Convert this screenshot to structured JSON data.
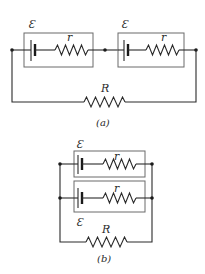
{
  "figure": {
    "panel_a": {
      "caption": "(a)",
      "description": "Two cells in series connected to external resistor",
      "cells": [
        {
          "emf_label": "Ɛ",
          "internal_resistance_label": "r"
        },
        {
          "emf_label": "Ɛ",
          "internal_resistance_label": "r"
        }
      ],
      "external_resistor_label": "R"
    },
    "panel_b": {
      "caption": "(b)",
      "description": "Two cells in parallel connected to external resistor",
      "cells": [
        {
          "emf_label": "Ɛ",
          "internal_resistance_label": "r"
        },
        {
          "emf_label": "Ɛ",
          "internal_resistance_label": "r"
        }
      ],
      "external_resistor_label": "R"
    }
  }
}
